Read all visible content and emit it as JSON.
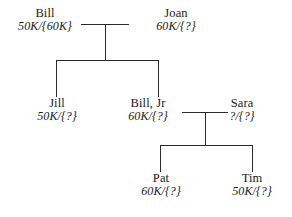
{
  "diagram": {
    "background_color": "#ffffff",
    "line_color": "#2a2a2a",
    "people": {
      "bill": {
        "name": "Bill",
        "value": "50K/{60K}"
      },
      "joan": {
        "name": "Joan",
        "value": "60K/{?}"
      },
      "jill": {
        "name": "Jill",
        "value": "50K/{?}"
      },
      "bill_jr": {
        "name": "Bill, Jr",
        "value": "60K/{?}"
      },
      "sara": {
        "name": "Sara",
        "value": "?/{?}"
      },
      "pat": {
        "name": "Pat",
        "value": "60K/{?}"
      },
      "tim": {
        "name": "Tim",
        "value": "50K/{?}"
      }
    }
  }
}
